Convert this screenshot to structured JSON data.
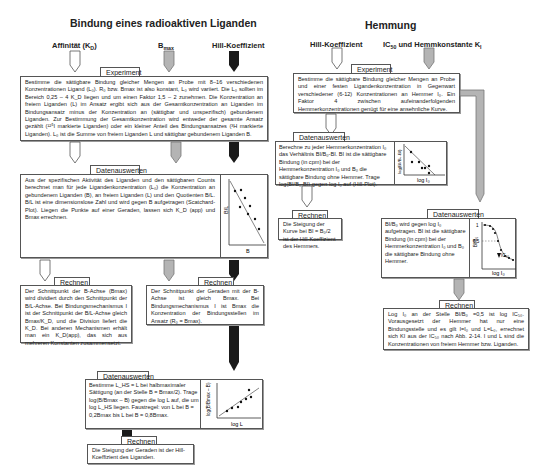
{
  "left": {
    "title": "Bindung eines radioaktiven Liganden",
    "headers": {
      "affinity": "Affinität (K",
      "affinity_sub": "D",
      "affinity_end": ")",
      "bmax": "B",
      "bmax_sub": "max",
      "hill": "Hill-Koeffizient"
    },
    "experiment": {
      "tag": "Experiment",
      "text": "Bestimme die sättigbare Bindung gleicher Mengen an Probe mit 8–16 verschiedenen Konzentrationen Ligand (L₀). R₀ bzw. Bmax ist also konstant, L₀ wird variiert. Die L₀ sollten im Bereich 0,25 – 4 K_D liegen und um einen Faktor 1,5 – 2 zunehmen. Die Konzentration an freiem Liganden (L) im Ansatz ergibt sich aus der Gesamtkonzentration an Liganden im Bindungsansatz minus der Konzentration an (sättigbar und unspezifisch) gebundenem Liganden. Zur Bestimmung der Gesamtkonzentration wird entweder der gesamte Ansatz gezählt (¹²⁵I markierte Liganden) oder ein kleiner Anteil des Bindungsansatzes (³H markierte Liganden). L₀ ist die Summe von freiem Liganden L und sättigbar gebundenem Liganden B."
    },
    "datenauswerten1": {
      "tag": "Datenauswerten",
      "text": "Aus der spezifischen Aktivität des Liganden und den sättigbaren Counts berechnet man für jede Ligandenkonzentration (L₀) die Konzentration an gebundenem Liganden (B), an freiem Liganden (L) und den Quotienten B/L. B/L ist eine dimensionslose Zahl und wird gegen B aufgetragen (Scatchard-Plot). Liegen die Punkte auf einer Geraden, lassen sich K_D (app) und Bmax errechnen.",
      "graph_ylabel": "B/L",
      "graph_xlabel": "B"
    },
    "rechnen1": {
      "tag": "Rechnen",
      "text": "Der Schnittpunkt der B-Achse (Bmax) wird dividiert durch den Schnittpunkt der B/L-Achse. Bei Bindungsmechanismus I ist der Schnittpunkt der B/L-Achse gleich Bmax/K_D, und die Division liefert die K_D. Bei anderen Mechanismen erhält man ein K_D(app), das sich aus mehreren Konstanten zusammensetzt."
    },
    "rechnen2": {
      "tag": "Rechnen",
      "text": "Der Schnittpunkt der Geraden mit der B-Achse ist gleich Bmax. Bei Bindungsmechanismus I ist Bmax die Konzentration der Bindungsstellen im Ansatz (R₀ = Bmax)."
    },
    "datenauswerten2": {
      "tag": "Datenauswerten",
      "text": "Bestimme L_HS = L bei halbmaximaler Sättigung (an der Stelle B = Bmax/2). Trage log(B/Bmax – B) gegen die log L auf, die um log L_HS liegen. Faustregel: von L bei B = 0,2Bmax bis L bei B = 0,8Bmax.",
      "graph_ylabel": "log(B/Bmax – B)",
      "graph_xlabel": "log L"
    },
    "rechnen3": {
      "tag": "Rechnen",
      "text": "Die Steigung der Geraden ist der Hill-Koeffizient des Liganden."
    }
  },
  "right": {
    "title": "Hemmung",
    "headers": {
      "hill": "Hill-Koeffizient",
      "ic50": "IC",
      "ic50_sub": "50",
      "ic50_rest": " und Hemmkonstante K",
      "ki_sub": "I"
    },
    "experiment": {
      "tag": "Experiment",
      "text": "Bestimme die sättigbare Bindung gleicher Mengen an Probe und einer festen Ligandenkonzentration in Gegenwart verschiedener (6-12) Konzentrationen an Hemmer I₀. Ein Faktor 4 zwischen aufeinanderfolgenden Hemmerkonzentrationen genügt für eine ansehnliche Kurve."
    },
    "datenauswerten1": {
      "tag": "Datenauswerten",
      "text": "Berechne zu jeder Hemmerkonzentration I₀ das Verhältnis BI/B₀-BI. BI ist die sättigbare Bindung (in cpm) bei der Hemmerkonzentration I₀ und B₀ die sättigbare Bindung ohne Hemmer. Trage log(BI/B₀-BI) gegen log I₀ auf (Hill-Plot).",
      "graph_ylabel": "log(BI/B₀-BI)",
      "graph_xlabel": "log I₀"
    },
    "rechnen1": {
      "tag": "Rechnen",
      "text": "Die Steigung der Kurve bei BI = B₀/2 ist der Hill-Koeffizient des Hemmers."
    },
    "datenauswerten2": {
      "tag": "Datenauswerten",
      "text": "BI/B₀ wird gegen log I₀ aufgetragen. BI ist die sättigbare Bindung (in cpm) bei der Hemmerkonzentration I₀ und B₀ die sättigbare Bindung ohne Hemmer.",
      "graph_ylabel": "BI/B₀",
      "graph_xlabel": "log I₀",
      "graph_y1": "1",
      "graph_y05": "0.5",
      "graph_marker": "IC₅₀"
    },
    "rechnen2": {
      "tag": "Rechnen",
      "text": "Log I₀ an der Stelle BI/B₀ =0,5 ist log IC₅₀. Vorausgesetzt der Hemmer hat nur eine Bindungsstelle und es gilt I=I₀ und L=L₀, errechnet sich KI aus der IC₅₀ nach Abb. 2-14. I und L sind die Konzentrationen von freiem Hemmer bzw. Liganden."
    }
  },
  "colors": {
    "white_arrow": "#ffffff",
    "gray_arrow": "#b4b4b4",
    "black_arrow": "#1a1a1a",
    "border": "#555555"
  }
}
